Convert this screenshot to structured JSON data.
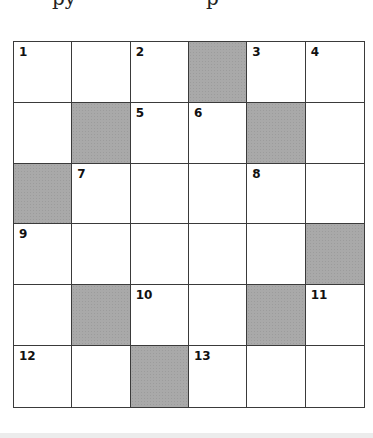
{
  "header": {
    "partial_text_left": "py",
    "partial_text_right": "p"
  },
  "crossword": {
    "rows": 6,
    "cols": 6,
    "shade_color": "#a9a9a9",
    "cells": [
      [
        {
          "n": "1"
        },
        {
          "n": ""
        },
        {
          "n": "2"
        },
        {
          "black": true
        },
        {
          "n": "3"
        },
        {
          "n": "4"
        }
      ],
      [
        {
          "n": ""
        },
        {
          "black": true
        },
        {
          "n": "5"
        },
        {
          "n": "6"
        },
        {
          "black": true
        },
        {
          "n": ""
        }
      ],
      [
        {
          "black": true
        },
        {
          "n": "7"
        },
        {
          "n": ""
        },
        {
          "n": ""
        },
        {
          "n": "8"
        },
        {
          "n": ""
        }
      ],
      [
        {
          "n": "9"
        },
        {
          "n": ""
        },
        {
          "n": ""
        },
        {
          "n": ""
        },
        {
          "n": ""
        },
        {
          "black": true
        }
      ],
      [
        {
          "n": ""
        },
        {
          "black": true
        },
        {
          "n": "10"
        },
        {
          "n": ""
        },
        {
          "black": true
        },
        {
          "n": "11"
        }
      ],
      [
        {
          "n": "12"
        },
        {
          "n": ""
        },
        {
          "black": true
        },
        {
          "n": "13"
        },
        {
          "n": ""
        },
        {
          "n": ""
        }
      ]
    ]
  }
}
